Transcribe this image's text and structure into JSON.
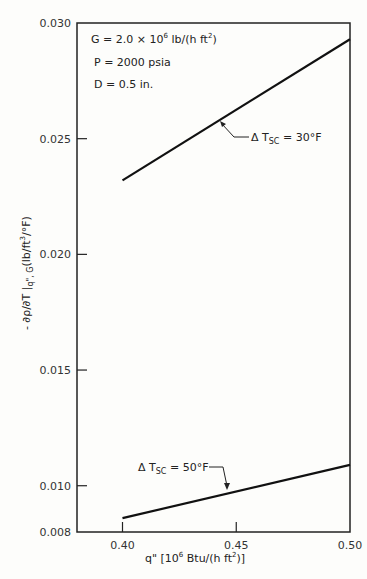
{
  "chart_data": {
    "type": "line",
    "title": "",
    "xlabel": "q\" [10^6 Btu/(h ft^2)]",
    "ylabel": "- ∂ρ/∂T |q\", G (lb/ft^3/°F)",
    "xlim": [
      0.38,
      0.5
    ],
    "ylim": [
      0.008,
      0.03
    ],
    "x_ticks": [
      0.4,
      0.45,
      0.5
    ],
    "x_tick_labels": [
      "0.40",
      "0.45",
      "0.50"
    ],
    "y_ticks": [
      0.008,
      0.01,
      0.015,
      0.02,
      0.025,
      0.03
    ],
    "y_tick_labels": [
      "0.008",
      "0.010",
      "0.015",
      "0.020",
      "0.025",
      "0.030"
    ],
    "grid": false,
    "conditions": [
      {
        "label": "G = 2.0 × 10",
        "exp": "6",
        "unit_pre": " lb/(h ft",
        "unit_exp": "2",
        "unit_post": ")"
      },
      {
        "label": "P = 2000 psia"
      },
      {
        "label": "D = 0.5 in."
      }
    ],
    "series": [
      {
        "name": "ΔT_SC = 30°F",
        "label_main": "Δ T",
        "label_sub": "SC",
        "label_rest": " = 30°F",
        "x": [
          0.4,
          0.5
        ],
        "y": [
          0.0232,
          0.0293
        ]
      },
      {
        "name": "ΔT_SC = 50°F",
        "label_main": "Δ T",
        "label_sub": "SC",
        "label_rest": " = 50°F",
        "x": [
          0.4,
          0.5
        ],
        "y": [
          0.0086,
          0.0109
        ]
      }
    ],
    "xlabel_parts": {
      "pre": "q\"  [10",
      "exp1": "6",
      "mid": " Btu/(h ft",
      "exp2": "2",
      "post": ")]"
    },
    "ylabel_parts": {
      "pre": "- ∂ρ/∂T |",
      "sub": "q\", G",
      "post": "(lb/ft",
      "exp": "3",
      "tail": "/°F)"
    }
  }
}
